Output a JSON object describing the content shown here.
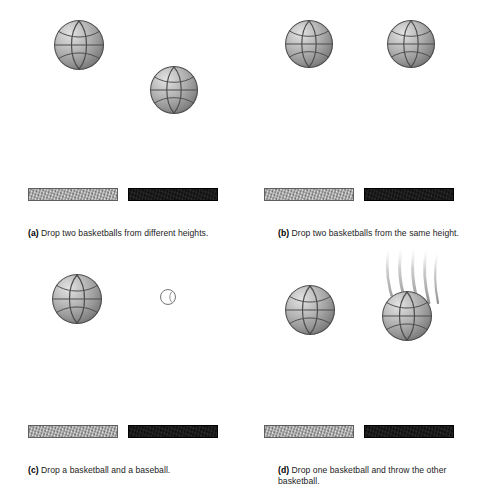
{
  "figure": {
    "background_color": "#ffffff",
    "panel_count": 4
  },
  "colors": {
    "ball_highlight": "#e2e2e2",
    "ball_midtone": "#989898",
    "ball_shadow": "#565656",
    "ball_seam": "#4a4a4a",
    "bar_light": "#9c9c9c",
    "bar_dark": "#0c0c0c",
    "baseball_fill": "#ffffff",
    "baseball_outline": "#777777",
    "caption_text": "#1c1c1c",
    "streak_color": "#b9b9b9"
  },
  "panels": [
    {
      "id": "a",
      "label": "(a)",
      "caption": "Drop two basketballs from different heights.",
      "caption_lines": [
        "Drop two basketballs from different heights."
      ],
      "objects": [
        {
          "kind": "basketball",
          "name": "basketball-high",
          "x": 54,
          "y": 20,
          "size": 50
        },
        {
          "kind": "basketball",
          "name": "basketball-low",
          "x": 150,
          "y": 66,
          "size": 48
        }
      ],
      "bars": [
        {
          "name": "surface-bar-light",
          "style": "light",
          "x": 28,
          "y": 188,
          "width": 90
        },
        {
          "name": "surface-bar-dark",
          "style": "dark",
          "x": 128,
          "y": 188,
          "width": 90
        }
      ]
    },
    {
      "id": "b",
      "label": "(b)",
      "caption": "Drop two basketballs from the same  height.",
      "caption_lines": [
        "Drop two basketballs from the",
        "same  height."
      ],
      "objects": [
        {
          "kind": "basketball",
          "name": "basketball-left",
          "x": 45,
          "y": 20,
          "size": 48
        },
        {
          "kind": "basketball",
          "name": "basketball-right",
          "x": 147,
          "y": 20,
          "size": 48
        }
      ],
      "bars": [
        {
          "name": "surface-bar-light",
          "style": "light",
          "x": 24,
          "y": 188,
          "width": 90
        },
        {
          "name": "surface-bar-dark",
          "style": "dark",
          "x": 124,
          "y": 188,
          "width": 90
        }
      ]
    },
    {
      "id": "c",
      "label": "(c)",
      "caption": "Drop a basketball and a baseball.",
      "caption_lines": [
        "Drop a basketball and a baseball."
      ],
      "objects": [
        {
          "kind": "basketball",
          "name": "basketball",
          "x": 52,
          "y": 27,
          "size": 50
        },
        {
          "kind": "baseball",
          "name": "baseball",
          "x": 160,
          "y": 42,
          "size": 16
        }
      ],
      "bars": [
        {
          "name": "surface-bar-light",
          "style": "light",
          "x": 28,
          "y": 178,
          "width": 90
        },
        {
          "name": "surface-bar-dark",
          "style": "dark",
          "x": 128,
          "y": 178,
          "width": 90
        }
      ]
    },
    {
      "id": "d",
      "label": "(d)",
      "caption": "Drop one basketball and throw the other basketball.",
      "caption_lines": [
        "Drop one basketball and throw the",
        "other basketball."
      ],
      "objects": [
        {
          "kind": "basketball",
          "name": "basketball-dropped",
          "x": 45,
          "y": 38,
          "size": 50
        },
        {
          "kind": "basketball",
          "name": "basketball-thrown",
          "x": 142,
          "y": 44,
          "size": 50
        },
        {
          "kind": "motion-streaks",
          "name": "motion-streaks",
          "x": 136,
          "y": 4,
          "width": 62,
          "height": 52,
          "count": 5
        }
      ],
      "bars": [
        {
          "name": "surface-bar-light",
          "style": "light",
          "x": 24,
          "y": 178,
          "width": 90
        },
        {
          "name": "surface-bar-dark",
          "style": "dark",
          "x": 124,
          "y": 178,
          "width": 90
        }
      ]
    }
  ]
}
